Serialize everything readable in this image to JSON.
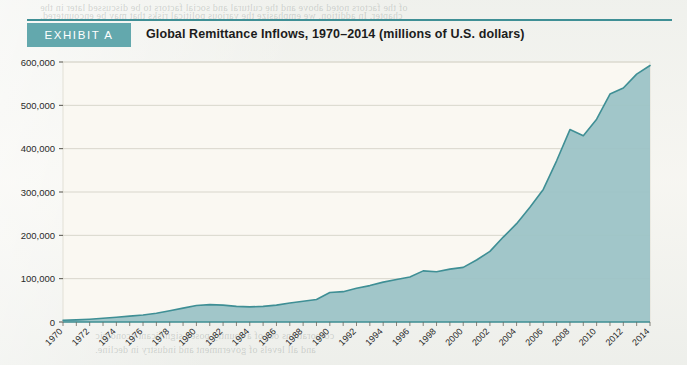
{
  "exhibit": {
    "tag": "EXHIBIT A",
    "title": "Global Remittance Inflows, 1970–2014 (millions of U.S. dollars)"
  },
  "colors": {
    "accent_teal": "#3f8f95",
    "tag_bg": "#63a8ad",
    "area_fill": "#9cc3c6",
    "line": "#3f8f95",
    "plot_bg": "#faf8f2",
    "gridline": "#d8d6cc",
    "page_bg": "#f4f3ee"
  },
  "ghost_text": {
    "heading": "SUMMARY POINTS",
    "lines": [
      "of the factors noted above and the cultural and social factors to be discussed later in the",
      "chapter. In addition, we emphasize the various political risks that may be encountered.",
      "It is the monetary exchange expertise that",
      "unites the international economy in the",
      "flow of capital from one country to another",
      "overnight.",
      "the tax, sub-sections of the GDP, this shows the",
      "most dramatic way to extract wealth and the inter-",
      "nal secrecy. These markets operate the currency",
      "trade and international capital flows in the country",
      "respectively.",
      "The current account and trade balances of",
      "investment of a country are in surplus or deficit.",
      "For China, however, they have been consistently",
      "surplus in both.",
      "Capital in economies that are relatively",
      "scarce and is expected to yield a return sufficient",
      "to generate advantage in abundant amounts",
      "of demand.",
      "Capital is mobile as an implied factor from",
      "the productive factor inputs of an economy; and",
      "the mobility is determined by the degrees of",
      "the productive.",
      "The ability of capital to move between",
      "countries is often held back by the asset",
      "dynamics of recent currency crises. In cases from",
      "Mexico in 1994 and Argentina in 2001, the",
      "country was unable to find its way out to a",
      "reduction in the ability of companies and",
      "corporations out of a country posed significant economic",
      "and all levels of government and industry in decline."
    ]
  },
  "chart_data": {
    "type": "area",
    "title": "Global Remittance Inflows, 1970–2014 (millions of U.S. dollars)",
    "xlabel": "",
    "ylabel": "",
    "ylim": [
      0,
      600000
    ],
    "yticks": [
      0,
      100000,
      200000,
      300000,
      400000,
      500000,
      600000
    ],
    "ytick_labels": [
      "0",
      "100,000",
      "200,000",
      "300,000",
      "400,000",
      "500,000",
      "600,000"
    ],
    "grid": true,
    "legend": "none",
    "xtick_labels": [
      "1970",
      "1972",
      "1974",
      "1976",
      "1978",
      "1980",
      "1982",
      "1984",
      "1986",
      "1988",
      "1990",
      "1992",
      "1994",
      "1996",
      "1998",
      "2000",
      "2002",
      "2004",
      "2006",
      "2008",
      "2010",
      "2012",
      "2014"
    ],
    "x": [
      1970,
      1971,
      1972,
      1973,
      1974,
      1975,
      1976,
      1977,
      1978,
      1979,
      1980,
      1981,
      1982,
      1983,
      1984,
      1985,
      1986,
      1987,
      1988,
      1989,
      1990,
      1991,
      1992,
      1993,
      1994,
      1995,
      1996,
      1997,
      1998,
      1999,
      2000,
      2001,
      2002,
      2003,
      2004,
      2005,
      2006,
      2007,
      2008,
      2009,
      2010,
      2011,
      2012,
      2013,
      2014
    ],
    "values": [
      4000,
      5000,
      6500,
      8500,
      11000,
      13500,
      16000,
      20000,
      26000,
      32000,
      38000,
      40000,
      39000,
      36000,
      35000,
      36000,
      39000,
      44000,
      48000,
      52000,
      68000,
      70000,
      78000,
      84000,
      92000,
      98000,
      104000,
      118000,
      116000,
      122000,
      126000,
      143000,
      163000,
      196000,
      227000,
      265000,
      306000,
      372000,
      444000,
      430000,
      468000,
      526000,
      540000,
      572000,
      592000
    ]
  }
}
